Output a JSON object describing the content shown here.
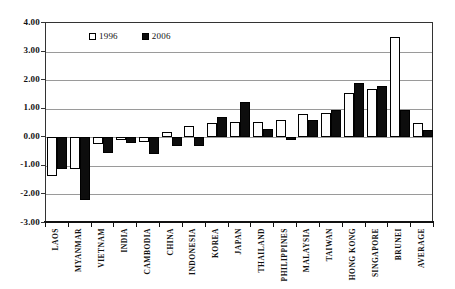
{
  "chart_data": {
    "type": "bar",
    "title": "",
    "xlabel": "",
    "ylabel": "",
    "categories": [
      "LAOS",
      "MYANMAR",
      "VIETNAM",
      "INDIA",
      "CAMBODIA",
      "CHINA",
      "INDONESIA",
      "KOREA",
      "JAPAN",
      "THAILAND",
      "PHILIPPINES",
      "MALAYSIA",
      "TAIWAN",
      "HONG KONG",
      "SINGAPORE",
      "BRUNEI",
      "AVERAGE"
    ],
    "series": [
      {
        "name": "1996",
        "color": "#ffffff",
        "values": [
          -1.35,
          -1.1,
          -0.25,
          -0.1,
          -0.15,
          0.2,
          0.4,
          0.5,
          0.55,
          0.55,
          0.6,
          0.8,
          0.85,
          1.55,
          1.7,
          3.5,
          0.5
        ]
      },
      {
        "name": "2006",
        "color": "#0d0d0d",
        "values": [
          -1.1,
          -2.2,
          -0.55,
          -0.2,
          -0.6,
          -0.3,
          -0.3,
          0.7,
          1.25,
          0.3,
          -0.1,
          0.6,
          0.95,
          1.9,
          1.8,
          0.95,
          0.25
        ]
      }
    ],
    "ylim": [
      -3,
      4
    ],
    "ytick_step": 1.0,
    "ytick_labels": [
      "4.00",
      "3.00",
      "2.00",
      "1.00",
      "0.00",
      "-1.00",
      "-2.00",
      "-3.00"
    ],
    "grid": true,
    "legend_position": "top-left-inside",
    "colors": {
      "grid": "#9a9a9a",
      "axis": "#111111",
      "bar_outline": "#000000"
    }
  }
}
